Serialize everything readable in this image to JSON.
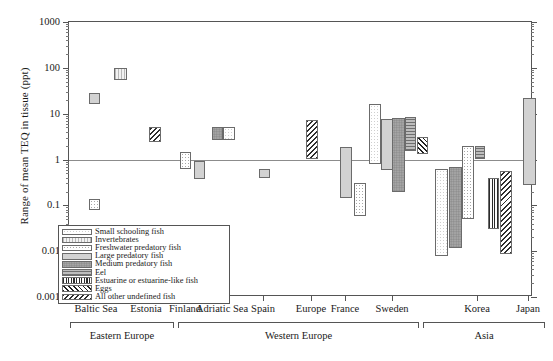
{
  "chart_data": {
    "type": "bar",
    "title": "",
    "xlabel": "",
    "ylabel": "Range of mean TEQ in tissue (ppt)",
    "yscale": "log",
    "ylim": [
      0.001,
      1000
    ],
    "ytick_labels": [
      "1000",
      "100",
      "10",
      "1",
      "0.1",
      "0.01",
      "0.001"
    ],
    "ytick_values": [
      1000,
      100,
      10,
      1,
      0.1,
      0.01,
      0.001
    ],
    "grid": false,
    "legend_position": "lower-left inside axes",
    "categories": [
      "Baltic Sea",
      "Estonia",
      "Finland",
      "Adriatic Sea",
      "Spain",
      "Europe",
      "France",
      "Sweden",
      "Korea",
      "Japan"
    ],
    "groups": [
      {
        "label": "Eastern Europe",
        "categories": [
          "Baltic Sea",
          "Estonia",
          "Finland"
        ]
      },
      {
        "label": "Western Europe",
        "categories": [
          "Adriatic Sea",
          "Spain",
          "Europe",
          "France",
          "Sweden"
        ]
      },
      {
        "label": "Asia",
        "categories": [
          "Korea",
          "Japan"
        ]
      }
    ],
    "series": [
      {
        "name": "Small schooling fish",
        "key": "small",
        "pattern": "fine-dots-white"
      },
      {
        "name": "Invertebrates",
        "key": "invert",
        "pattern": "vertical-fine-lines"
      },
      {
        "name": "Freshwater predatory fish",
        "key": "fresh",
        "pattern": "coarse-dots"
      },
      {
        "name": "Large predatory fish",
        "key": "large",
        "pattern": "solid-light-gray"
      },
      {
        "name": "Medium predatory fish",
        "key": "medium",
        "pattern": "solid-mid-gray-speckle"
      },
      {
        "name": "Eel",
        "key": "eel",
        "pattern": "horizontal-lines-gray"
      },
      {
        "name": "Estuarine or estuarine-like fish",
        "key": "estuar",
        "pattern": "bold-vertical-lines"
      },
      {
        "name": "Eggs",
        "key": "eggs",
        "pattern": "cross-hatch"
      },
      {
        "name": "All other undefined fish",
        "key": "other",
        "pattern": "diagonal-hatch"
      }
    ],
    "bars": [
      {
        "category": "Baltic Sea",
        "series": "large",
        "low": 16,
        "high": 28
      },
      {
        "category": "Baltic Sea",
        "series": "fresh",
        "low": 0.078,
        "high": 0.14
      },
      {
        "category": "Estonia",
        "series": "invert",
        "low": 55,
        "high": 100
      },
      {
        "category": "Estonia",
        "series": "other",
        "low": 2.4,
        "high": 5.2
      },
      {
        "category": "Finland",
        "series": "fresh",
        "low": 0.62,
        "high": 1.45
      },
      {
        "category": "Finland",
        "series": "large",
        "low": 0.38,
        "high": 0.95
      },
      {
        "category": "Adriatic Sea",
        "series": "medium",
        "low": 2.6,
        "high": 5.0
      },
      {
        "category": "Adriatic Sea",
        "series": "small",
        "low": 2.6,
        "high": 5.0
      },
      {
        "category": "Spain",
        "series": "large",
        "low": 0.4,
        "high": 0.62
      },
      {
        "category": "Europe",
        "series": "other",
        "low": 1.05,
        "high": 7.2
      },
      {
        "category": "France",
        "series": "large",
        "low": 0.145,
        "high": 1.9
      },
      {
        "category": "Sweden",
        "series": "fresh",
        "low": 0.058,
        "high": 0.3
      },
      {
        "category": "Sweden",
        "series": "small",
        "low": 0.8,
        "high": 16
      },
      {
        "category": "Sweden",
        "series": "large",
        "low": 0.6,
        "high": 7.5
      },
      {
        "category": "Sweden",
        "series": "medium",
        "low": 0.2,
        "high": 8.0
      },
      {
        "category": "Sweden",
        "series": "eel",
        "low": 1.5,
        "high": 8.5
      },
      {
        "category": "Sweden",
        "series": "eggs",
        "low": 1.35,
        "high": 3.1
      },
      {
        "category": "Korea",
        "series": "small",
        "low": 0.0078,
        "high": 0.62
      },
      {
        "category": "Korea",
        "series": "medium",
        "low": 0.012,
        "high": 0.7
      },
      {
        "category": "Korea",
        "series": "fresh",
        "low": 0.05,
        "high": 2.0
      },
      {
        "category": "Korea",
        "series": "eel",
        "low": 1.05,
        "high": 2.0
      },
      {
        "category": "Korea",
        "series": "estuar",
        "low": 0.03,
        "high": 0.4
      },
      {
        "category": "Korea",
        "series": "other",
        "low": 0.0085,
        "high": 0.55
      },
      {
        "category": "Japan",
        "series": "large",
        "low": 0.28,
        "high": 22
      }
    ]
  },
  "legend": {
    "items": [
      {
        "label": "Small schooling fish"
      },
      {
        "label": "Invertebrates"
      },
      {
        "label": "Freshwater predatory fish"
      },
      {
        "label": "Large predatory fish"
      },
      {
        "label": "Medium predatory fish"
      },
      {
        "label": "Eel"
      },
      {
        "label": "Estuarine or estuarine-like fish"
      },
      {
        "label": "Eggs"
      },
      {
        "label": "All other undefined fish"
      }
    ]
  },
  "axis": {
    "y_title": "Range of mean TEQ in tissue (ppt)"
  }
}
